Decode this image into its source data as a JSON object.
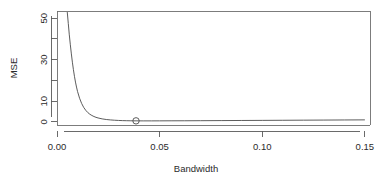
{
  "chart_data": {
    "type": "line",
    "title": "",
    "xlabel": "Bandwidth",
    "ylabel": "MSE",
    "xlim": [
      0.0,
      0.1525
    ],
    "ylim": [
      -1.5,
      53.5
    ],
    "grid": false,
    "legend": null,
    "x_ticks": [
      0.0,
      0.05,
      0.1,
      0.15
    ],
    "x_tick_labels": [
      "0.00",
      "0.05",
      "0.10",
      "0.15"
    ],
    "y_ticks": [
      0,
      10,
      20,
      30,
      40,
      50
    ],
    "y_tick_labels": [
      "0",
      "10",
      "",
      "30",
      "",
      "50"
    ],
    "series": [
      {
        "name": "MSE",
        "x": [
          0.005,
          0.0055,
          0.006,
          0.0065,
          0.007,
          0.0075,
          0.008,
          0.0085,
          0.009,
          0.0095,
          0.01,
          0.011,
          0.012,
          0.013,
          0.014,
          0.015,
          0.016,
          0.017,
          0.018,
          0.019,
          0.02,
          0.022,
          0.024,
          0.026,
          0.028,
          0.03,
          0.032,
          0.034,
          0.036,
          0.0385,
          0.042,
          0.046,
          0.05,
          0.056,
          0.062,
          0.07,
          0.08,
          0.09,
          0.1,
          0.11,
          0.12,
          0.13,
          0.14,
          0.15
        ],
        "y": [
          53.0,
          47.5,
          42.0,
          37.2,
          32.8,
          28.8,
          25.2,
          22.0,
          19.2,
          16.8,
          14.7,
          11.4,
          8.9,
          7.0,
          5.6,
          4.5,
          3.7,
          3.1,
          2.6,
          2.2,
          1.9,
          1.45,
          1.15,
          0.95,
          0.8,
          0.7,
          0.62,
          0.57,
          0.53,
          0.5,
          0.49,
          0.49,
          0.5,
          0.52,
          0.54,
          0.58,
          0.63,
          0.68,
          0.73,
          0.78,
          0.83,
          0.88,
          0.93,
          0.98
        ]
      }
    ],
    "annotations": [
      {
        "kind": "open-circle-marker",
        "label": "optimal-bandwidth",
        "x": 0.0385,
        "y": 0.5
      }
    ]
  }
}
